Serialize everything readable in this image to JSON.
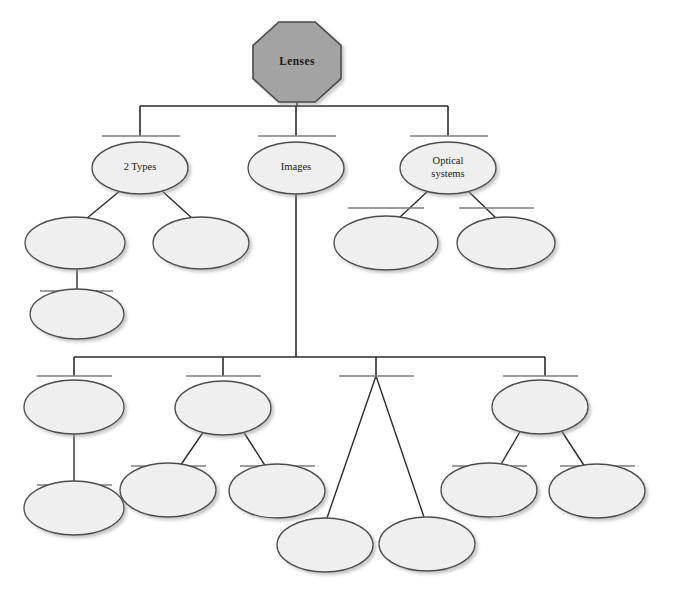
{
  "diagram": {
    "title_node": {
      "label": "Lenses",
      "shape": "octagon",
      "fill": "#a3a3a3",
      "stroke": "#4a4a4a"
    },
    "style": {
      "ellipse_fill": "#efefef",
      "ellipse_stroke": "#4d4d4d",
      "connector_color": "#2b2b2b",
      "writing_line_color": "#7d7d7d",
      "background": "#ffffff"
    },
    "nodes": [
      {
        "id": "n-root",
        "label": "Lenses",
        "shape": "octagon",
        "cx": 297,
        "cy": 62,
        "rx": 44,
        "ry": 40,
        "filled": true,
        "has_writing_line": false
      },
      {
        "id": "n-2types",
        "label": "2 Types",
        "shape": "ellipse",
        "cx": 140,
        "cy": 168,
        "rx": 48,
        "ry": 26,
        "filled": false,
        "has_writing_line": true
      },
      {
        "id": "n-images",
        "label": "Images",
        "shape": "ellipse",
        "cx": 296,
        "cy": 168,
        "rx": 48,
        "ry": 26,
        "filled": false,
        "has_writing_line": true
      },
      {
        "id": "n-optical",
        "label": "Optical\nsystems",
        "shape": "ellipse",
        "cx": 448,
        "cy": 168,
        "rx": 48,
        "ry": 26,
        "filled": false,
        "has_writing_line": true
      },
      {
        "id": "n-b1",
        "label": "",
        "shape": "ellipse",
        "cx": 75,
        "cy": 243,
        "rx": 50,
        "ry": 26,
        "filled": false,
        "has_writing_line": false
      },
      {
        "id": "n-b2",
        "label": "",
        "shape": "ellipse",
        "cx": 201,
        "cy": 243,
        "rx": 48,
        "ry": 26,
        "filled": false,
        "has_writing_line": false
      },
      {
        "id": "n-b3",
        "label": "",
        "shape": "ellipse",
        "cx": 77,
        "cy": 314,
        "rx": 47,
        "ry": 25,
        "filled": false,
        "has_writing_line": true
      },
      {
        "id": "n-b4",
        "label": "",
        "shape": "ellipse",
        "cx": 386,
        "cy": 243,
        "rx": 52,
        "ry": 27,
        "filled": false,
        "has_writing_line": true
      },
      {
        "id": "n-b5",
        "label": "",
        "shape": "ellipse",
        "cx": 506,
        "cy": 243,
        "rx": 49,
        "ry": 26,
        "filled": false,
        "has_writing_line": true
      },
      {
        "id": "n-c1",
        "label": "",
        "shape": "ellipse",
        "cx": 74,
        "cy": 407,
        "rx": 50,
        "ry": 27,
        "filled": false,
        "has_writing_line": true
      },
      {
        "id": "n-c1a",
        "label": "",
        "shape": "ellipse",
        "cx": 74,
        "cy": 508,
        "rx": 50,
        "ry": 27,
        "filled": false,
        "has_writing_line": true
      },
      {
        "id": "n-c2",
        "label": "",
        "shape": "ellipse",
        "cx": 223,
        "cy": 408,
        "rx": 48,
        "ry": 27,
        "filled": false,
        "has_writing_line": true
      },
      {
        "id": "n-c2a",
        "label": "",
        "shape": "ellipse",
        "cx": 168,
        "cy": 490,
        "rx": 48,
        "ry": 27,
        "filled": false,
        "has_writing_line": true
      },
      {
        "id": "n-c2b",
        "label": "",
        "shape": "ellipse",
        "cx": 277,
        "cy": 491,
        "rx": 48,
        "ry": 27,
        "filled": false,
        "has_writing_line": true
      },
      {
        "id": "n-c3a",
        "label": "",
        "shape": "ellipse",
        "cx": 325,
        "cy": 545,
        "rx": 48,
        "ry": 27,
        "filled": false,
        "has_writing_line": false
      },
      {
        "id": "n-c3b",
        "label": "",
        "shape": "ellipse",
        "cx": 427,
        "cy": 544,
        "rx": 48,
        "ry": 27,
        "filled": false,
        "has_writing_line": false
      },
      {
        "id": "n-c4",
        "label": "",
        "shape": "ellipse",
        "cx": 540,
        "cy": 407,
        "rx": 48,
        "ry": 27,
        "filled": false,
        "has_writing_line": true
      },
      {
        "id": "n-c4a",
        "label": "",
        "shape": "ellipse",
        "cx": 489,
        "cy": 490,
        "rx": 48,
        "ry": 27,
        "filled": false,
        "has_writing_line": true
      },
      {
        "id": "n-c4b",
        "label": "",
        "shape": "ellipse",
        "cx": 597,
        "cy": 491,
        "rx": 48,
        "ry": 27,
        "filled": false,
        "has_writing_line": true
      }
    ],
    "bus_connectors": [
      {
        "id": "bus-top",
        "trunk_x": 297,
        "trunk_y1": 102,
        "bus_y": 106,
        "x_left": 140,
        "x_right": 448,
        "drops": [
          140,
          296,
          448
        ],
        "drop_to_y": 136
      },
      {
        "id": "bus-bottom",
        "trunk_x": 296,
        "trunk_y1": 194,
        "bus_y": 357,
        "x_left": 74,
        "x_right": 545,
        "drops": [
          74,
          223,
          376,
          545
        ],
        "drop_to_y": 376
      }
    ],
    "straight_links": [
      {
        "from": "n-2types",
        "to": "n-b1",
        "x1": 121,
        "y1": 190,
        "x2": 86,
        "y2": 219
      },
      {
        "from": "n-2types",
        "to": "n-b2",
        "x1": 161,
        "y1": 190,
        "x2": 193,
        "y2": 219
      },
      {
        "from": "n-b1",
        "to": "n-b3",
        "x1": 77,
        "y1": 269,
        "x2": 77,
        "y2": 291
      },
      {
        "from": "n-optical",
        "to": "n-b4",
        "x1": 429,
        "y1": 190,
        "x2": 399,
        "y2": 218
      },
      {
        "from": "n-optical",
        "to": "n-b5",
        "x1": 467,
        "y1": 190,
        "x2": 496,
        "y2": 218
      },
      {
        "from": "n-c1",
        "to": "n-c1a",
        "x1": 74,
        "y1": 434,
        "x2": 74,
        "y2": 485
      },
      {
        "from": "n-c2",
        "to": "n-c2a",
        "x1": 204,
        "y1": 431,
        "x2": 180,
        "y2": 466
      },
      {
        "from": "n-c2",
        "to": "n-c2b",
        "x1": 243,
        "y1": 431,
        "x2": 266,
        "y2": 467
      },
      {
        "from": "bus-bottom-3",
        "to": "n-c3a",
        "x1": 376,
        "y1": 376,
        "x2": 327,
        "y2": 518
      },
      {
        "from": "bus-bottom-3",
        "to": "n-c3b",
        "x1": 376,
        "y1": 376,
        "x2": 424,
        "y2": 517
      },
      {
        "from": "n-c4",
        "to": "n-c4a",
        "x1": 521,
        "y1": 430,
        "x2": 500,
        "y2": 466
      },
      {
        "from": "n-c4",
        "to": "n-c4b",
        "x1": 561,
        "y1": 430,
        "x2": 585,
        "y2": 467
      }
    ],
    "writing_lines": [
      {
        "for": "n-2types",
        "x1": 102,
        "x2": 180,
        "y": 136
      },
      {
        "for": "n-images",
        "x1": 258,
        "x2": 336,
        "y": 136
      },
      {
        "for": "n-optical",
        "x1": 410,
        "x2": 488,
        "y": 136
      },
      {
        "for": "n-b3",
        "x1": 40,
        "x2": 113,
        "y": 291
      },
      {
        "for": "n-b4",
        "x1": 348,
        "x2": 424,
        "y": 208
      },
      {
        "for": "n-b5",
        "x1": 459,
        "x2": 534,
        "y": 208
      },
      {
        "for": "n-c1",
        "x1": 37,
        "x2": 112,
        "y": 376
      },
      {
        "for": "n-c1a",
        "x1": 37,
        "x2": 112,
        "y": 485
      },
      {
        "for": "n-c2",
        "x1": 186,
        "x2": 261,
        "y": 376
      },
      {
        "for": "n-c2a",
        "x1": 131,
        "x2": 206,
        "y": 466
      },
      {
        "for": "n-c2b",
        "x1": 240,
        "x2": 315,
        "y": 466
      },
      {
        "for": "n-branch3",
        "x1": 339,
        "x2": 414,
        "y": 376
      },
      {
        "for": "n-c4",
        "x1": 503,
        "x2": 578,
        "y": 376
      },
      {
        "for": "n-c4a",
        "x1": 452,
        "x2": 527,
        "y": 466
      },
      {
        "for": "n-c4b",
        "x1": 560,
        "x2": 635,
        "y": 466
      }
    ]
  }
}
